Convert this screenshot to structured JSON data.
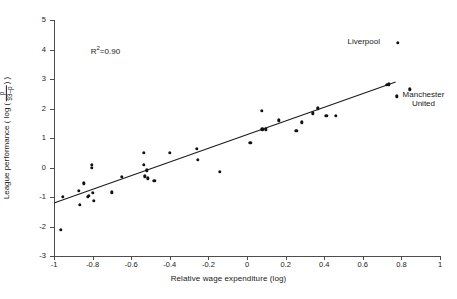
{
  "chart_data": {
    "type": "scatter",
    "title": "",
    "xlabel": "Relative wage expenditure (log)",
    "ylabel_parts": {
      "prefix": "League performance ( log (",
      "numerator": "p",
      "denominator": "93–p",
      "suffix": ") )"
    },
    "ylabel": "League performance ( log ( p/(93–p) ) )",
    "xlim": [
      -1,
      1
    ],
    "ylim": [
      -3,
      5
    ],
    "xticks": [
      -1,
      -0.8,
      -0.6,
      -0.4,
      -0.2,
      0,
      0.2,
      0.4,
      0.6,
      0.8,
      1
    ],
    "xtick_labels": [
      "-1",
      "-0.8",
      "-0.6",
      "-0.4",
      "-0.2",
      "0",
      "0.2",
      "0.4",
      "0.6",
      "0.8",
      "1"
    ],
    "yticks": [
      -3,
      -2,
      -1,
      0,
      1,
      2,
      3,
      4,
      5
    ],
    "ytick_labels": [
      "-3",
      "-2",
      "-1",
      "0",
      "1",
      "2",
      "3",
      "4",
      "5"
    ],
    "grid": false,
    "legend": false,
    "marker": "filled-circle",
    "marker_color": "#111111",
    "fit_line": {
      "color": "#1a1a1a",
      "x_start": -1.0,
      "y_start": -1.2,
      "x_end": 0.77,
      "y_end": 2.9,
      "slope": 2.32,
      "intercept": 1.12
    },
    "annotations": [
      {
        "text": "R²=0.90",
        "base": "R",
        "sup": "2",
        "rest": "=0.90",
        "x": -0.82,
        "y": 4.0
      },
      {
        "text": "Liverpool",
        "x": 0.78,
        "y": 4.22,
        "label_side": "left"
      },
      {
        "text": "Manchester United",
        "line1": "Manchester",
        "line2": "United",
        "x": 0.775,
        "y": 2.42,
        "label_side": "right"
      }
    ],
    "points": [
      {
        "x": -0.965,
        "y": -2.11
      },
      {
        "x": -0.955,
        "y": -1.0
      },
      {
        "x": -0.87,
        "y": -0.78
      },
      {
        "x": -0.865,
        "y": -1.27
      },
      {
        "x": -0.845,
        "y": -0.53
      },
      {
        "x": -0.825,
        "y": -1.0
      },
      {
        "x": -0.82,
        "y": -0.95
      },
      {
        "x": -0.805,
        "y": 0.1
      },
      {
        "x": -0.805,
        "y": -0.02
      },
      {
        "x": -0.8,
        "y": -0.86
      },
      {
        "x": -0.795,
        "y": -1.12
      },
      {
        "x": -0.7,
        "y": -0.84
      },
      {
        "x": -0.65,
        "y": -0.32
      },
      {
        "x": -0.535,
        "y": 0.5
      },
      {
        "x": -0.535,
        "y": 0.1
      },
      {
        "x": -0.53,
        "y": -0.3
      },
      {
        "x": -0.52,
        "y": -0.1
      },
      {
        "x": -0.515,
        "y": -0.36
      },
      {
        "x": -0.48,
        "y": -0.45
      },
      {
        "x": -0.4,
        "y": 0.5
      },
      {
        "x": -0.26,
        "y": 0.63
      },
      {
        "x": -0.255,
        "y": 0.26
      },
      {
        "x": -0.14,
        "y": -0.15
      },
      {
        "x": 0.018,
        "y": 0.84
      },
      {
        "x": 0.078,
        "y": 1.93
      },
      {
        "x": 0.08,
        "y": 1.3
      },
      {
        "x": 0.098,
        "y": 1.3
      },
      {
        "x": 0.165,
        "y": 1.6
      },
      {
        "x": 0.255,
        "y": 1.24
      },
      {
        "x": 0.285,
        "y": 1.53
      },
      {
        "x": 0.34,
        "y": 1.84
      },
      {
        "x": 0.368,
        "y": 2.01
      },
      {
        "x": 0.41,
        "y": 1.76
      },
      {
        "x": 0.46,
        "y": 1.76
      },
      {
        "x": 0.725,
        "y": 2.81
      },
      {
        "x": 0.735,
        "y": 2.82
      },
      {
        "x": 0.775,
        "y": 2.42
      },
      {
        "x": 0.78,
        "y": 4.22
      },
      {
        "x": 0.845,
        "y": 2.65
      }
    ]
  }
}
